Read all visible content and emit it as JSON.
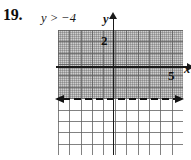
{
  "problem": {
    "number": "19.",
    "inequality": "y > −4"
  },
  "chart_data": {
    "type": "line",
    "title": "y > −4",
    "xlabel": "x",
    "ylabel": "y",
    "xlim": [
      -5,
      6
    ],
    "ylim": [
      -7,
      4
    ],
    "grid": true,
    "legend": null,
    "tick_labels": {
      "x": [
        "5"
      ],
      "y": [
        "2"
      ]
    },
    "axis_end_labels": {
      "x": "x",
      "y": "y"
    },
    "boundary": {
      "equation": "y = −4",
      "style": "dashed",
      "value": -4,
      "orientation": "horizontal",
      "arrows": "both",
      "color": "#111111"
    },
    "shaded_region": {
      "description": "half-plane above the dashed line",
      "condition": "y > -4",
      "includes_boundary": false,
      "color": "#6e6e6e"
    },
    "annotations": [
      {
        "text": "2",
        "x": 0,
        "y": 2,
        "role": "y-tick-label"
      },
      {
        "text": "5",
        "x": 5,
        "y": 0,
        "role": "x-tick-label"
      },
      {
        "text": "y",
        "role": "y-axis-end-label"
      },
      {
        "text": "x",
        "role": "x-axis-end-label"
      }
    ]
  }
}
